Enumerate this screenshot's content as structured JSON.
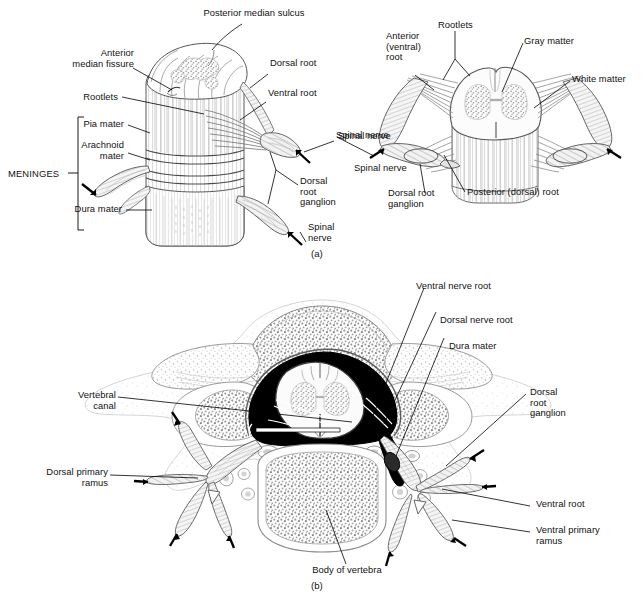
{
  "figure": {
    "panels": [
      {
        "tag": "(a)",
        "name": "spinal-cord-segment-and-meninges",
        "description": "Anterolateral view of a spinal cord segment with meninges (left) and transverse view of spinal cord with rootlets and spinal nerves (right)"
      },
      {
        "tag": "(b)",
        "name": "vertebra-cross-section",
        "description": "Transverse section through a vertebra showing the spinal cord within the vertebral canal and the emerging spinal nerve"
      }
    ]
  },
  "panel_a": {
    "tag": "(a)",
    "left_view": {
      "labels": [
        {
          "id": "posterior-median-sulcus",
          "text": "Posterior median sulcus",
          "align": "center"
        },
        {
          "id": "anterior-median-fissure",
          "text": "Anterior\nmedian fissure",
          "align": "right"
        },
        {
          "id": "rootlets",
          "text": "Rootlets",
          "align": "right"
        },
        {
          "id": "pia-mater",
          "text": "Pia mater",
          "align": "right"
        },
        {
          "id": "arachnoid-mater",
          "text": "Arachnoid\nmater",
          "align": "right"
        },
        {
          "id": "dura-mater",
          "text": "Dura mater",
          "align": "right"
        },
        {
          "id": "meninges-bracket",
          "text": "MENINGES",
          "align": "right"
        },
        {
          "id": "dorsal-root",
          "text": "Dorsal root",
          "align": "left"
        },
        {
          "id": "ventral-root",
          "text": "Ventral root",
          "align": "left"
        },
        {
          "id": "spinal-nerve-upper",
          "text": "Spinal nerve",
          "align": "left"
        },
        {
          "id": "dorsal-root-ganglion",
          "text": "Dorsal\nroot\nganglion",
          "align": "left"
        },
        {
          "id": "spinal-nerve-lower",
          "text": "Spinal\nnerve",
          "align": "left"
        }
      ]
    },
    "right_view": {
      "labels": [
        {
          "id": "anterior-ventral-root",
          "text": "Anterior\n(ventral)\nroot",
          "align": "left"
        },
        {
          "id": "rootlets",
          "text": "Rootlets",
          "align": "left"
        },
        {
          "id": "gray-matter",
          "text": "Gray matter",
          "align": "left"
        },
        {
          "id": "white-matter",
          "text": "White matter",
          "align": "left"
        },
        {
          "id": "spinal-nerve-right",
          "text": "Spinal nerve",
          "align": "left"
        },
        {
          "id": "spinal-nerve-left",
          "text": "Spinal nerve",
          "align": "left"
        },
        {
          "id": "dorsal-root-ganglion",
          "text": "Dorsal root\nganglion",
          "align": "left"
        },
        {
          "id": "posterior-dorsal-root",
          "text": "Posterior (dorsal) root",
          "align": "left"
        }
      ]
    }
  },
  "panel_b": {
    "tag": "(b)",
    "labels": [
      {
        "id": "ventral-nerve-root",
        "text": "Ventral nerve root",
        "align": "left"
      },
      {
        "id": "dorsal-nerve-root",
        "text": "Dorsal nerve root",
        "align": "left"
      },
      {
        "id": "dura-mater",
        "text": "Dura mater",
        "align": "left"
      },
      {
        "id": "dorsal-root-ganglion",
        "text": "Dorsal\nroot\nganglion",
        "align": "left"
      },
      {
        "id": "ventral-root",
        "text": "Ventral root",
        "align": "left"
      },
      {
        "id": "ventral-primary-ramus",
        "text": "Ventral primary\nramus",
        "align": "left"
      },
      {
        "id": "vertebral-canal",
        "text": "Vertebral\ncanal",
        "align": "right"
      },
      {
        "id": "dorsal-primary-ramus",
        "text": "Dorsal primary\nramus",
        "align": "right"
      },
      {
        "id": "body-of-vertebra",
        "text": "Body of vertebra",
        "align": "center"
      }
    ]
  },
  "colors": {
    "ink": "#111111",
    "line": "#000000",
    "bone_fill": "#ffffff",
    "bone_stipple": "#8a8a8a",
    "cord_gray_matter": "#bdbdbd",
    "cord_white_matter": "#f4f4f4",
    "subarachnoid_space": "#000000",
    "nerve_fill": "#e9e9e9",
    "background": "#ffffff"
  }
}
